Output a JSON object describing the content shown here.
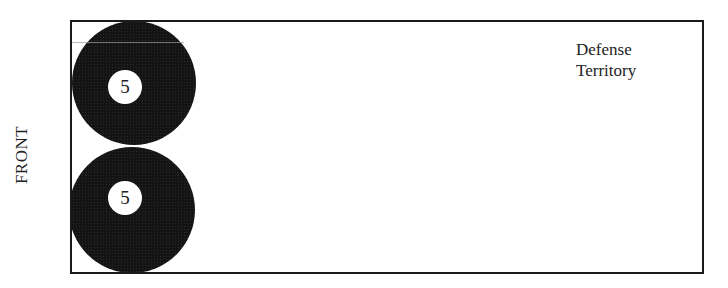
{
  "diagram": {
    "side_label": "FRONT",
    "territory_label_line1": "Defense",
    "territory_label_line2": "Territory",
    "players": [
      {
        "number": "5",
        "position": "top"
      },
      {
        "number": "5",
        "position": "bottom"
      }
    ],
    "colors": {
      "border": "#1a1a1a",
      "player_fill": "#141414",
      "badge": "#ffffff"
    }
  }
}
